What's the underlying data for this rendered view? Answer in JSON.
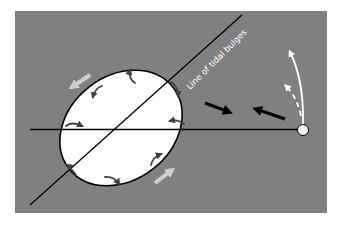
{
  "diagram": {
    "label": "Line of tidal bulges",
    "colors": {
      "background": "#ffffff",
      "panel": "#808080",
      "earth": "#ffffff",
      "outline": "#000000",
      "flow_arrows": "#404040",
      "rotation_arrows": "#cfcfcf",
      "moon_path": "#ffffff"
    },
    "elements": {
      "earth": "tidally-distorted Earth (ellipse)",
      "earth_moon_line": "horizontal line through Earth center to Moon",
      "bulge_line": "diagonal line of tidal bulges",
      "moon": "small white circle",
      "force_arrows": "two black arrows (torque on bulges)",
      "moon_orbit_arrows": "solid and dashed white curved arrows",
      "earth_rotation_arrows": "light gray arrows along ellipse edge",
      "internal_flow_arrows": "small dark curved arrows inside Earth"
    }
  }
}
